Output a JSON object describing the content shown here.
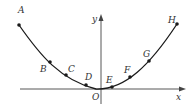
{
  "diagram": {
    "type": "parabola-with-points",
    "axes": {
      "x_label": "x",
      "y_label": "y",
      "origin_label": "O"
    },
    "points": [
      {
        "name": "A",
        "x": 19,
        "y": 25,
        "lx": 18,
        "ly": 13
      },
      {
        "name": "B",
        "x": 50,
        "y": 62,
        "lx": 40,
        "ly": 72
      },
      {
        "name": "C",
        "x": 66,
        "y": 75,
        "lx": 68,
        "ly": 72
      },
      {
        "name": "D",
        "x": 86,
        "y": 85,
        "lx": 85,
        "ly": 80
      },
      {
        "name": "E",
        "x": 112,
        "y": 87,
        "lx": 106,
        "ly": 83
      },
      {
        "name": "F",
        "x": 130,
        "y": 77,
        "lx": 124,
        "ly": 73
      },
      {
        "name": "G",
        "x": 149,
        "y": 61,
        "lx": 143,
        "ly": 57
      },
      {
        "name": "H",
        "x": 177,
        "y": 24,
        "lx": 168,
        "ly": 23
      }
    ],
    "colors": {
      "curve": "#1a1a1a",
      "axis": "#444444",
      "text": "#333333"
    }
  }
}
